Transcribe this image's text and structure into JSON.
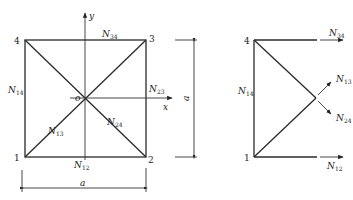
{
  "left_figure": {
    "nodes": [
      {
        "id": "1",
        "label": "1"
      },
      {
        "id": "2",
        "label": "2"
      },
      {
        "id": "3",
        "label": "3"
      },
      {
        "id": "4",
        "label": "4"
      }
    ],
    "origin_label": "o",
    "axis_x_label": "x",
    "axis_y_label": "y",
    "members": {
      "N12": {
        "base": "N",
        "sub": "12"
      },
      "N23": {
        "base": "N",
        "sub": "23"
      },
      "N34": {
        "base": "N",
        "sub": "34"
      },
      "N14": {
        "base": "N",
        "sub": "14"
      },
      "N13": {
        "base": "N",
        "sub": "13"
      },
      "N24": {
        "base": "N",
        "sub": "24"
      }
    },
    "dim_horizontal": "a",
    "dim_vertical": "a"
  },
  "right_figure": {
    "nodes": [
      {
        "id": "1",
        "label": "1"
      },
      {
        "id": "4",
        "label": "4"
      }
    ],
    "members": {
      "N34": {
        "base": "N",
        "sub": "34"
      },
      "N14": {
        "base": "N",
        "sub": "14"
      },
      "N13": {
        "base": "N",
        "sub": "13"
      },
      "N24": {
        "base": "N",
        "sub": "24"
      },
      "N12": {
        "base": "N",
        "sub": "12"
      }
    }
  }
}
